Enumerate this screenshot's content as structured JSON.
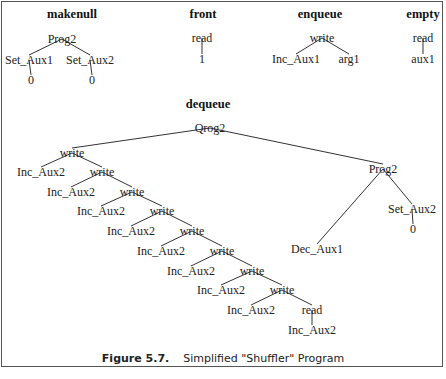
{
  "figure": {
    "number": "Figure 5.7.",
    "title": "Simplified \"Shuffler\" Program"
  },
  "trees": [
    {
      "name": "makenull",
      "header": {
        "x": 72,
        "y": 18
      },
      "nodes": [
        {
          "id": "p",
          "label": "Prog2",
          "x": 62,
          "y": 43
        },
        {
          "id": "s1",
          "label": "Set_Aux1",
          "x": 29,
          "y": 64
        },
        {
          "id": "s2",
          "label": "Set_Aux2",
          "x": 90,
          "y": 64
        },
        {
          "id": "z1",
          "label": "0",
          "x": 31,
          "y": 84
        },
        {
          "id": "z2",
          "label": "0",
          "x": 92,
          "y": 84
        }
      ],
      "edges": [
        [
          "p",
          "s1"
        ],
        [
          "p",
          "s2"
        ],
        [
          "s1",
          "z1"
        ],
        [
          "s2",
          "z2"
        ]
      ]
    },
    {
      "name": "front",
      "header": {
        "x": 203,
        "y": 18
      },
      "nodes": [
        {
          "id": "r",
          "label": "read",
          "x": 202,
          "y": 42
        },
        {
          "id": "o",
          "label": "1",
          "x": 202,
          "y": 63
        }
      ],
      "edges": [
        [
          "r",
          "o"
        ]
      ]
    },
    {
      "name": "enqueue",
      "header": {
        "x": 320,
        "y": 18
      },
      "nodes": [
        {
          "id": "w",
          "label": "write",
          "x": 322,
          "y": 42
        },
        {
          "id": "i",
          "label": "Inc_Aux1",
          "x": 296,
          "y": 63
        },
        {
          "id": "a",
          "label": "arg1",
          "x": 349,
          "y": 63
        }
      ],
      "edges": [
        [
          "w",
          "i"
        ],
        [
          "w",
          "a"
        ]
      ]
    },
    {
      "name": "empty",
      "header": {
        "x": 423,
        "y": 18
      },
      "nodes": [
        {
          "id": "r",
          "label": "read",
          "x": 423,
          "y": 42
        },
        {
          "id": "a",
          "label": "aux1",
          "x": 423,
          "y": 63
        }
      ],
      "edges": [
        [
          "r",
          "a"
        ]
      ]
    },
    {
      "name": "dequeue",
      "header": {
        "x": 208,
        "y": 108
      },
      "nodes": [
        {
          "id": "q",
          "label": "Qrog2",
          "x": 210,
          "y": 132
        },
        {
          "id": "w1",
          "label": "write",
          "x": 72,
          "y": 157
        },
        {
          "id": "i1",
          "label": "Inc_Aux2",
          "x": 41,
          "y": 176
        },
        {
          "id": "w2",
          "label": "write",
          "x": 102,
          "y": 176
        },
        {
          "id": "i2",
          "label": "Inc_Aux2",
          "x": 71,
          "y": 196
        },
        {
          "id": "w3",
          "label": "write",
          "x": 132,
          "y": 196
        },
        {
          "id": "i3",
          "label": "Inc_Aux2",
          "x": 101,
          "y": 215
        },
        {
          "id": "w4",
          "label": "write",
          "x": 162,
          "y": 215
        },
        {
          "id": "i4",
          "label": "Inc_Aux2",
          "x": 131,
          "y": 235
        },
        {
          "id": "w5",
          "label": "write",
          "x": 192,
          "y": 235
        },
        {
          "id": "i5",
          "label": "Inc_Aux2",
          "x": 161,
          "y": 255
        },
        {
          "id": "w6",
          "label": "write",
          "x": 222,
          "y": 255
        },
        {
          "id": "i6",
          "label": "Inc_Aux2",
          "x": 191,
          "y": 275
        },
        {
          "id": "w7",
          "label": "write",
          "x": 252,
          "y": 275
        },
        {
          "id": "i7",
          "label": "Inc_Aux2",
          "x": 221,
          "y": 294
        },
        {
          "id": "w8",
          "label": "write",
          "x": 282,
          "y": 294
        },
        {
          "id": "i8",
          "label": "Inc_Aux2",
          "x": 251,
          "y": 314
        },
        {
          "id": "r",
          "label": "read",
          "x": 312,
          "y": 314
        },
        {
          "id": "i9",
          "label": "Inc_Aux2",
          "x": 312,
          "y": 334
        },
        {
          "id": "p2",
          "label": "Prog2",
          "x": 383,
          "y": 173
        },
        {
          "id": "d",
          "label": "Dec_Aux1",
          "x": 317,
          "y": 253
        },
        {
          "id": "s2",
          "label": "Set_Aux2",
          "x": 412,
          "y": 213
        },
        {
          "id": "z",
          "label": "0",
          "x": 413,
          "y": 233
        }
      ],
      "edges": [
        [
          "q",
          "w1"
        ],
        [
          "q",
          "p2"
        ],
        [
          "w1",
          "i1"
        ],
        [
          "w1",
          "w2"
        ],
        [
          "w2",
          "i2"
        ],
        [
          "w2",
          "w3"
        ],
        [
          "w3",
          "i3"
        ],
        [
          "w3",
          "w4"
        ],
        [
          "w4",
          "i4"
        ],
        [
          "w4",
          "w5"
        ],
        [
          "w5",
          "i5"
        ],
        [
          "w5",
          "w6"
        ],
        [
          "w6",
          "i6"
        ],
        [
          "w6",
          "w7"
        ],
        [
          "w7",
          "i7"
        ],
        [
          "w7",
          "w8"
        ],
        [
          "w8",
          "i8"
        ],
        [
          "w8",
          "r"
        ],
        [
          "r",
          "i9"
        ],
        [
          "p2",
          "d"
        ],
        [
          "p2",
          "s2"
        ],
        [
          "s2",
          "z"
        ]
      ]
    }
  ]
}
